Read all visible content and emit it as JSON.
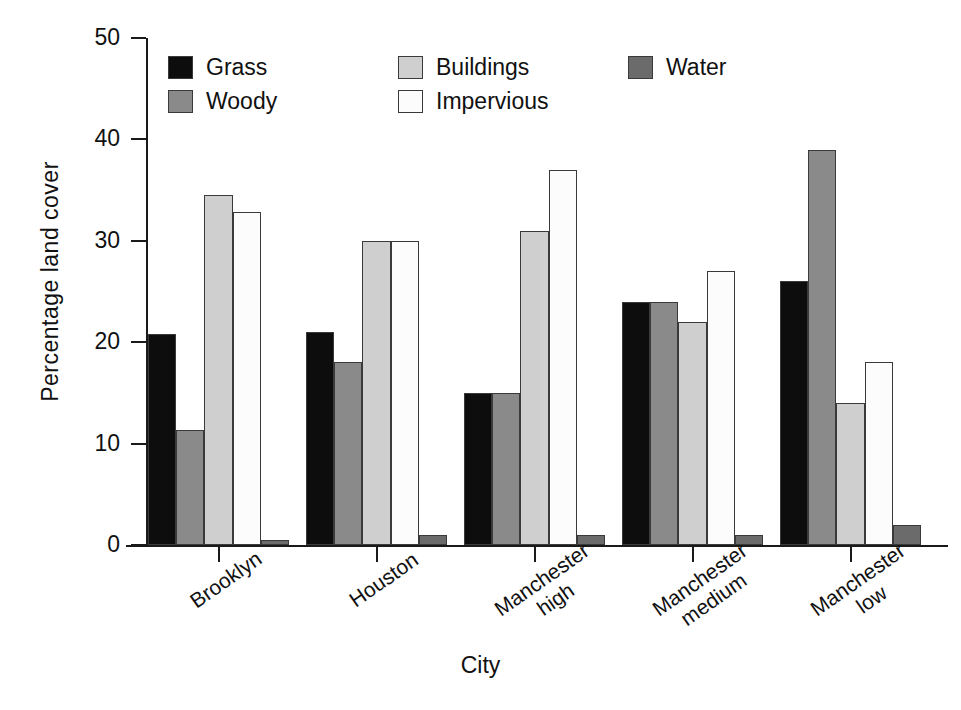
{
  "chart_data": {
    "type": "bar",
    "title": "",
    "xlabel": "City",
    "ylabel": "Percentage land cover",
    "categories": [
      "Brooklyn",
      "Houston",
      "Manchester high",
      "Manchester medium",
      "Manchester low"
    ],
    "category_labels": [
      "Brooklyn",
      "Houston",
      "Manchester\nhigh",
      "Manchester\nmedium",
      "Manchester\nlow"
    ],
    "series": [
      {
        "name": "Grass",
        "color": "#0d0d0d",
        "values": [
          20.8,
          21.0,
          15.0,
          24.0,
          26.0
        ]
      },
      {
        "name": "Woody",
        "color": "#8a8a8a",
        "values": [
          11.3,
          18.0,
          15.0,
          24.0,
          39.0
        ]
      },
      {
        "name": "Buildings",
        "color": "#cfcfcf",
        "values": [
          34.5,
          30.0,
          31.0,
          22.0,
          14.0
        ]
      },
      {
        "name": "Impervious",
        "color": "#fcfcfc",
        "values": [
          32.8,
          30.0,
          37.0,
          27.0,
          18.0
        ]
      },
      {
        "name": "Water",
        "color": "#6b6b6b",
        "values": [
          0.5,
          1.0,
          1.0,
          1.0,
          2.0
        ]
      }
    ],
    "ylim": [
      0,
      50
    ],
    "yticks": [
      0,
      10,
      20,
      30,
      40,
      50
    ],
    "ytick_labels": [
      "0",
      "10",
      "20",
      "30",
      "40",
      "50"
    ],
    "grid": false,
    "legend": {
      "position": "top-inside",
      "entries": [
        {
          "label": "Grass",
          "color": "#0d0d0d"
        },
        {
          "label": "Woody",
          "color": "#8a8a8a"
        },
        {
          "label": "Buildings",
          "color": "#cfcfcf"
        },
        {
          "label": "Impervious",
          "color": "#fcfcfc"
        },
        {
          "label": "Water",
          "color": "#6b6b6b"
        }
      ]
    }
  }
}
